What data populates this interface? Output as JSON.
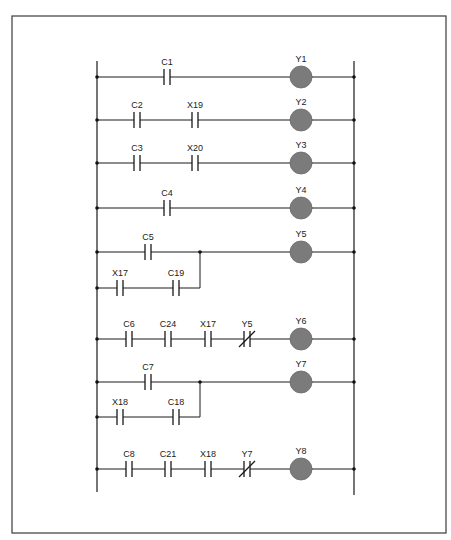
{
  "diagram": {
    "type": "ladder-logic",
    "frame": {
      "x": 12,
      "y": 16,
      "w": 434,
      "h": 517
    },
    "left_rail": {
      "x": 97,
      "y1": 61,
      "y2": 492
    },
    "right_rail": {
      "x": 354,
      "y1": 61,
      "y2": 495
    },
    "coil_x": 301,
    "colors": {
      "coil": "#7b7b7b",
      "line": "#1a1a1a"
    },
    "rungs": [
      {
        "output": "Y1",
        "y": 77,
        "contacts": [
          {
            "label": "C1",
            "type": "NO",
            "x": 167
          }
        ],
        "branch": null
      },
      {
        "output": "Y2",
        "y": 120,
        "contacts": [
          {
            "label": "C2",
            "type": "NO",
            "x": 137
          },
          {
            "label": "X19",
            "type": "NO",
            "x": 195
          }
        ],
        "branch": null
      },
      {
        "output": "Y3",
        "y": 163,
        "contacts": [
          {
            "label": "C3",
            "type": "NO",
            "x": 137
          },
          {
            "label": "X20",
            "type": "NO",
            "x": 195
          }
        ],
        "branch": null
      },
      {
        "output": "Y4",
        "y": 208,
        "contacts": [
          {
            "label": "C4",
            "type": "NO",
            "x": 167
          }
        ],
        "branch": null
      },
      {
        "output": "Y5",
        "y": 252,
        "contacts": [
          {
            "label": "C5",
            "type": "NO",
            "x": 148
          }
        ],
        "branch": {
          "y": 288,
          "join_x": 200,
          "contacts": [
            {
              "label": "X17",
              "type": "NO",
              "x": 120
            },
            {
              "label": "C19",
              "type": "NO",
              "x": 176
            }
          ]
        }
      },
      {
        "output": "Y6",
        "y": 339,
        "contacts": [
          {
            "label": "C6",
            "type": "NO",
            "x": 129
          },
          {
            "label": "C24",
            "type": "NO",
            "x": 168
          },
          {
            "label": "X17",
            "type": "NO",
            "x": 208
          },
          {
            "label": "Y5",
            "type": "NC",
            "x": 247
          }
        ],
        "branch": null
      },
      {
        "output": "Y7",
        "y": 382,
        "contacts": [
          {
            "label": "C7",
            "type": "NO",
            "x": 148
          }
        ],
        "branch": {
          "y": 417,
          "join_x": 200,
          "contacts": [
            {
              "label": "X18",
              "type": "NO",
              "x": 120
            },
            {
              "label": "C18",
              "type": "NO",
              "x": 176
            }
          ]
        }
      },
      {
        "output": "Y8",
        "y": 469,
        "contacts": [
          {
            "label": "C8",
            "type": "NO",
            "x": 129
          },
          {
            "label": "C21",
            "type": "NO",
            "x": 168
          },
          {
            "label": "X18",
            "type": "NO",
            "x": 208
          },
          {
            "label": "Y7",
            "type": "NC",
            "x": 247
          }
        ],
        "branch": null
      }
    ]
  }
}
